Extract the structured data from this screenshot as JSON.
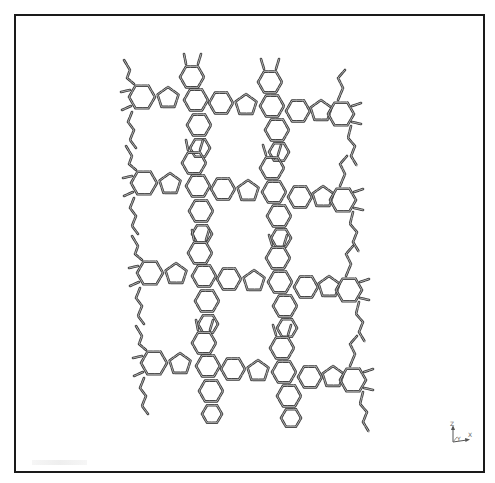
{
  "scene": {
    "type": "molecular-structure-render",
    "description": "2D porous carbon network (hexagon clusters linked by pentagons) rendered as tube/stick model",
    "background": "#ffffff",
    "bond_color": "#3a3a3a",
    "bond_highlight": "#bdbdbd",
    "frame_color": "#1a1a1a"
  },
  "motif": {
    "rings": [
      {
        "cx": 142,
        "cy": 97,
        "r": 13,
        "n": 6
      },
      {
        "cx": 168,
        "cy": 98,
        "r": 11,
        "n": 5
      },
      {
        "cx": 192,
        "cy": 77,
        "r": 12,
        "n": 6
      },
      {
        "cx": 196,
        "cy": 100,
        "r": 12,
        "n": 6
      },
      {
        "cx": 221,
        "cy": 103,
        "r": 12,
        "n": 6
      },
      {
        "cx": 199,
        "cy": 125,
        "r": 12,
        "n": 6
      },
      {
        "cx": 200,
        "cy": 148,
        "r": 10,
        "n": 6
      },
      {
        "cx": 246,
        "cy": 105,
        "r": 11,
        "n": 5
      },
      {
        "cx": 270,
        "cy": 82,
        "r": 12,
        "n": 6
      },
      {
        "cx": 272,
        "cy": 106,
        "r": 12,
        "n": 6
      },
      {
        "cx": 298,
        "cy": 111,
        "r": 12,
        "n": 6
      },
      {
        "cx": 277,
        "cy": 130,
        "r": 12,
        "n": 6
      },
      {
        "cx": 279,
        "cy": 152,
        "r": 10,
        "n": 6
      },
      {
        "cx": 321,
        "cy": 111,
        "r": 11,
        "n": 5
      },
      {
        "cx": 341,
        "cy": 114,
        "r": 13,
        "n": 6
      }
    ],
    "chains": [
      [
        [
          124,
          60
        ],
        [
          130,
          70
        ],
        [
          127,
          78
        ],
        [
          134,
          84
        ]
      ],
      [
        [
          132,
          112
        ],
        [
          128,
          122
        ],
        [
          134,
          130
        ],
        [
          130,
          140
        ],
        [
          136,
          148
        ]
      ],
      [
        [
          186,
          64
        ],
        [
          184,
          54
        ]
      ],
      [
        [
          198,
          64
        ],
        [
          201,
          54
        ]
      ],
      [
        [
          264,
          69
        ],
        [
          261,
          59
        ]
      ],
      [
        [
          276,
          69
        ],
        [
          279,
          59
        ]
      ],
      [
        [
          338,
          100
        ],
        [
          343,
          88
        ],
        [
          338,
          78
        ],
        [
          345,
          70
        ]
      ],
      [
        [
          351,
          126
        ],
        [
          348,
          138
        ],
        [
          355,
          146
        ],
        [
          351,
          156
        ],
        [
          357,
          166
        ]
      ]
    ],
    "stubs": [
      [
        [
          130,
          90
        ],
        [
          121,
          92
        ]
      ],
      [
        [
          131,
          106
        ],
        [
          122,
          110
        ]
      ],
      [
        [
          352,
          106
        ],
        [
          361,
          103
        ]
      ],
      [
        [
          352,
          122
        ],
        [
          361,
          124
        ]
      ]
    ]
  },
  "rows": [
    {
      "dx": 0,
      "dy": 0
    },
    {
      "dx": 2,
      "dy": 86
    },
    {
      "dx": 8,
      "dy": 176
    },
    {
      "dx": 12,
      "dy": 266
    }
  ],
  "axis_triad": {
    "labels": {
      "z": "Z",
      "x": "X",
      "y": "Y"
    }
  }
}
